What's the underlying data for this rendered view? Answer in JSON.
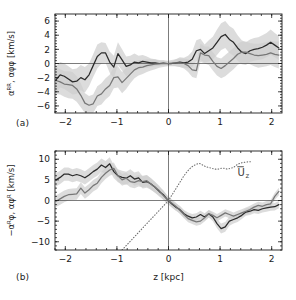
{
  "figure": {
    "background": "#ffffff",
    "width": 296,
    "height": 300
  },
  "panels": [
    {
      "tag": "(a)",
      "ylabel": "αᴿᴿ,  αφφ   [km/s]",
      "xlabel": "",
      "ytick_labels": [
        "6",
        "4",
        "2",
        "0",
        "−2",
        "−4",
        "−6"
      ],
      "xtick_labels": [
        "−2",
        "−1",
        "0",
        "1",
        "2"
      ]
    },
    {
      "tag": "(b)",
      "ylabel": "−αᴿφ,  αφᴿ   [km/s]",
      "xlabel": "z  [kpc]",
      "ytick_labels": [
        "10",
        "5",
        "0",
        "−5",
        "−10"
      ],
      "xtick_labels": [
        "−2",
        "−1",
        "0",
        "1",
        "2"
      ],
      "annotation": "U̅z"
    }
  ],
  "colors": {
    "dark_curve": "#2b2b2b",
    "gray_curve": "#777777",
    "band": "#cfcfcf",
    "axis": "#1a1a1a",
    "zero_line": "#444444",
    "dotted_curve": "#6e6e6e"
  },
  "chart_data": [
    {
      "type": "line",
      "title": "(a)",
      "xlabel": "z [kpc]",
      "ylabel": "alpha_RR, alpha_phiphi [km/s]",
      "xlim": [
        -2.2,
        2.2
      ],
      "ylim": [
        -7.0,
        7.0
      ],
      "xticks": [
        -2,
        -1,
        0,
        1,
        2
      ],
      "yticks": [
        -6,
        -4,
        -2,
        0,
        2,
        4,
        6
      ],
      "grid": false,
      "legend": "none",
      "zero_lines": {
        "horizontal": 0,
        "vertical": 0
      },
      "x": [
        -2.18,
        -2.1,
        -2.02,
        -1.94,
        -1.86,
        -1.78,
        -1.7,
        -1.62,
        -1.54,
        -1.46,
        -1.38,
        -1.3,
        -1.22,
        -1.14,
        -1.06,
        -0.98,
        -0.9,
        -0.82,
        -0.74,
        -0.66,
        -0.58,
        -0.5,
        -0.42,
        -0.34,
        -0.26,
        -0.18,
        -0.1,
        -0.02,
        0.06,
        0.14,
        0.22,
        0.3,
        0.38,
        0.46,
        0.54,
        0.62,
        0.7,
        0.78,
        0.86,
        0.94,
        1.02,
        1.1,
        1.18,
        1.26,
        1.34,
        1.42,
        1.5,
        1.58,
        1.66,
        1.74,
        1.82,
        1.9,
        1.98,
        2.06,
        2.14
      ],
      "series": [
        {
          "name": "alpha_RR",
          "color": "#2b2b2b",
          "values": [
            -2.3,
            -1.6,
            -1.8,
            -2.2,
            -2.6,
            -2.5,
            -2.0,
            -2.3,
            -1.6,
            -0.3,
            1.0,
            1.5,
            1.5,
            0.2,
            -0.5,
            1.4,
            0.5,
            -0.4,
            -0.2,
            0.2,
            0.1,
            0.3,
            0.2,
            0.1,
            0.1,
            0.0,
            0.05,
            0.0,
            0.0,
            0.1,
            0.2,
            0.1,
            0.2,
            0.6,
            1.8,
            2.0,
            1.4,
            1.8,
            2.2,
            3.0,
            3.8,
            4.1,
            3.4,
            3.0,
            2.2,
            1.6,
            1.4,
            1.8,
            2.0,
            2.1,
            2.3,
            2.6,
            3.0,
            2.6,
            2.2
          ],
          "band_lower": [
            -4.2,
            -3.4,
            -3.6,
            -4.0,
            -4.4,
            -4.3,
            -3.8,
            -4.1,
            -3.2,
            -1.9,
            -0.7,
            0.0,
            0.1,
            -1.3,
            -2.1,
            -0.2,
            -1.0,
            -1.8,
            -1.5,
            -1.0,
            -0.9,
            -0.6,
            -0.6,
            -0.5,
            -0.4,
            -0.4,
            -0.3,
            -0.3,
            -0.3,
            -0.4,
            -0.5,
            -0.6,
            -0.7,
            -0.5,
            0.3,
            0.5,
            0.1,
            0.3,
            0.6,
            1.2,
            1.9,
            2.2,
            1.5,
            1.1,
            0.4,
            -0.1,
            -0.2,
            0.2,
            0.4,
            0.5,
            0.6,
            0.9,
            1.2,
            0.9,
            0.5
          ],
          "band_upper": [
            -0.4,
            0.2,
            0.0,
            -0.4,
            -0.8,
            -0.7,
            -0.2,
            -0.5,
            0.0,
            1.3,
            2.7,
            3.0,
            2.9,
            1.7,
            1.1,
            3.0,
            2.0,
            1.0,
            1.1,
            1.4,
            1.1,
            1.2,
            1.0,
            0.7,
            0.6,
            0.4,
            0.4,
            0.3,
            0.3,
            0.6,
            0.9,
            0.8,
            1.1,
            1.7,
            3.3,
            3.5,
            2.7,
            3.3,
            3.8,
            4.8,
            5.7,
            6.0,
            5.3,
            4.9,
            4.0,
            3.3,
            3.0,
            3.4,
            3.6,
            3.7,
            4.0,
            4.3,
            4.8,
            4.3,
            3.9
          ]
        },
        {
          "name": "alpha_phiphi",
          "color": "#777777",
          "values": [
            -2.4,
            -2.6,
            -2.9,
            -3.0,
            -3.1,
            -3.6,
            -4.5,
            -5.6,
            -5.9,
            -5.7,
            -4.6,
            -4.3,
            -3.6,
            -3.1,
            -2.0,
            -1.9,
            -2.7,
            -2.1,
            -1.5,
            -0.9,
            -0.6,
            -0.5,
            -0.3,
            -0.2,
            -0.1,
            -0.05,
            0.0,
            0.0,
            0.05,
            0.1,
            0.1,
            0.0,
            -0.3,
            -0.9,
            -1.0,
            1.5,
            1.2,
            1.1,
            0.3,
            -0.4,
            -0.7,
            -0.3,
            0.2,
            0.7,
            1.3,
            1.6,
            1.6,
            1.4,
            1.2,
            1.1,
            1.2,
            1.3,
            1.5,
            1.3,
            1.2
          ],
          "band_lower": [
            -4.3,
            -4.4,
            -4.7,
            -4.9,
            -5.0,
            -5.4,
            -6.2,
            -7.0,
            -7.2,
            -7.0,
            -6.0,
            -5.8,
            -5.1,
            -4.6,
            -3.5,
            -3.4,
            -4.2,
            -3.6,
            -2.8,
            -2.1,
            -1.7,
            -1.5,
            -1.2,
            -1.0,
            -0.8,
            -0.6,
            -0.5,
            -0.4,
            -0.4,
            -0.4,
            -0.5,
            -0.7,
            -1.2,
            -1.9,
            -2.1,
            0.2,
            0.0,
            -0.2,
            -1.0,
            -1.7,
            -2.1,
            -1.8,
            -1.3,
            -0.8,
            -0.2,
            0.1,
            0.1,
            -0.1,
            -0.4,
            -0.6,
            -0.5,
            -0.4,
            -0.2,
            -0.5,
            -0.7
          ],
          "band_upper": [
            -0.5,
            -0.8,
            -1.1,
            -1.1,
            -1.2,
            -1.8,
            -2.8,
            -4.2,
            -4.6,
            -4.4,
            -3.2,
            -2.8,
            -2.1,
            -1.6,
            -0.5,
            -0.4,
            -1.2,
            -0.6,
            -0.2,
            0.3,
            0.5,
            0.5,
            0.6,
            0.6,
            0.6,
            0.5,
            0.5,
            0.4,
            0.5,
            0.6,
            0.7,
            0.7,
            0.6,
            0.1,
            0.1,
            2.8,
            2.4,
            2.4,
            1.6,
            0.9,
            0.7,
            1.2,
            1.7,
            2.2,
            2.8,
            3.1,
            3.1,
            2.9,
            2.8,
            2.8,
            2.9,
            3.0,
            3.2,
            3.1,
            3.1
          ]
        }
      ]
    },
    {
      "type": "line",
      "title": "(b)",
      "xlabel": "z [kpc]",
      "ylabel": "-alpha_Rphi, alpha_phiR [km/s]",
      "xlim": [
        -2.2,
        2.2
      ],
      "ylim": [
        -12.0,
        12.0
      ],
      "xticks": [
        -2,
        -1,
        0,
        1,
        2
      ],
      "yticks": [
        -10,
        -5,
        0,
        5,
        10
      ],
      "grid": false,
      "legend": "none",
      "zero_lines": {
        "horizontal": 0,
        "vertical": 0
      },
      "x": [
        -2.18,
        -2.1,
        -2.02,
        -1.94,
        -1.86,
        -1.78,
        -1.7,
        -1.62,
        -1.54,
        -1.46,
        -1.38,
        -1.3,
        -1.22,
        -1.14,
        -1.06,
        -0.98,
        -0.9,
        -0.82,
        -0.74,
        -0.66,
        -0.58,
        -0.5,
        -0.42,
        -0.34,
        -0.26,
        -0.18,
        -0.1,
        -0.02,
        0.06,
        0.14,
        0.22,
        0.3,
        0.38,
        0.46,
        0.54,
        0.62,
        0.7,
        0.78,
        0.86,
        0.94,
        1.02,
        1.1,
        1.18,
        1.26,
        1.34,
        1.42,
        1.5,
        1.58,
        1.66,
        1.74,
        1.82,
        1.9,
        1.98,
        2.06,
        2.14
      ],
      "series": [
        {
          "name": "-alpha_Rphi",
          "color": "#2b2b2b",
          "values": [
            5.0,
            5.6,
            6.4,
            6.4,
            6.0,
            6.3,
            6.0,
            5.5,
            6.2,
            7.0,
            7.6,
            8.6,
            8.0,
            8.9,
            7.0,
            6.0,
            5.6,
            5.4,
            6.0,
            5.2,
            5.5,
            4.4,
            4.6,
            4.0,
            3.2,
            2.2,
            1.4,
            0.2,
            -0.8,
            -1.6,
            -2.2,
            -3.2,
            -3.8,
            -4.2,
            -4.0,
            -3.4,
            -4.0,
            -3.2,
            -4.0,
            -5.6,
            -6.8,
            -6.4,
            -5.0,
            -4.6,
            -4.2,
            -3.6,
            -2.8,
            -2.6,
            -2.2,
            -2.4,
            -2.0,
            -1.8,
            -1.6,
            -1.5,
            -1.0
          ],
          "band_lower": [
            3.4,
            4.0,
            4.8,
            4.8,
            4.4,
            4.7,
            4.4,
            3.9,
            4.6,
            5.4,
            6.0,
            7.0,
            6.4,
            7.3,
            5.4,
            4.4,
            4.0,
            3.8,
            4.4,
            3.6,
            3.9,
            2.9,
            3.1,
            2.6,
            1.9,
            1.0,
            0.3,
            -0.7,
            -1.7,
            -2.5,
            -3.1,
            -4.1,
            -4.7,
            -5.1,
            -4.9,
            -4.3,
            -4.9,
            -4.1,
            -5.0,
            -6.7,
            -8.0,
            -7.6,
            -6.1,
            -5.6,
            -5.2,
            -4.5,
            -3.7,
            -3.5,
            -3.1,
            -3.3,
            -2.9,
            -2.7,
            -2.5,
            -2.4,
            -1.9
          ],
          "band_upper": [
            6.6,
            7.2,
            8.0,
            8.0,
            7.6,
            7.9,
            7.6,
            7.1,
            7.8,
            8.6,
            9.2,
            10.2,
            9.6,
            10.5,
            8.6,
            7.6,
            7.2,
            7.0,
            7.6,
            6.8,
            7.1,
            5.9,
            6.1,
            5.4,
            4.5,
            3.4,
            2.5,
            1.1,
            0.1,
            -0.7,
            -1.3,
            -2.3,
            -2.9,
            -3.3,
            -3.1,
            -2.5,
            -3.1,
            -2.3,
            -3.0,
            -4.5,
            -5.6,
            -5.2,
            -3.9,
            -3.6,
            -3.2,
            -2.7,
            -1.9,
            -1.7,
            -1.3,
            -1.5,
            -1.1,
            -0.9,
            -0.7,
            -0.6,
            -0.1
          ]
        },
        {
          "name": "alpha_phiR",
          "color": "#777777",
          "values": [
            -0.2,
            0.4,
            1.0,
            1.4,
            1.5,
            1.6,
            3.0,
            1.8,
            2.6,
            3.6,
            4.2,
            5.6,
            6.6,
            7.4,
            7.8,
            6.0,
            5.0,
            5.4,
            4.6,
            4.4,
            4.8,
            4.6,
            4.8,
            4.0,
            3.2,
            2.4,
            1.2,
            0.2,
            -0.6,
            -1.4,
            -2.4,
            -3.4,
            -4.4,
            -4.8,
            -5.2,
            -5.0,
            -4.2,
            -3.2,
            -3.6,
            -4.2,
            -3.6,
            -3.0,
            -3.4,
            -3.8,
            -3.4,
            -3.0,
            -2.6,
            -2.2,
            -1.6,
            -1.2,
            -1.4,
            -1.0,
            -0.8,
            1.0,
            2.2
          ],
          "band_lower": [
            -1.6,
            -1.0,
            -0.4,
            0.0,
            0.1,
            0.2,
            1.6,
            0.4,
            1.2,
            2.2,
            2.8,
            4.2,
            5.2,
            6.0,
            6.4,
            4.6,
            3.6,
            4.0,
            3.2,
            3.0,
            3.4,
            3.2,
            3.4,
            2.6,
            1.9,
            1.2,
            0.1,
            -0.8,
            -1.5,
            -2.3,
            -3.3,
            -4.3,
            -5.3,
            -5.7,
            -6.1,
            -5.9,
            -5.1,
            -4.1,
            -4.5,
            -5.1,
            -4.5,
            -3.9,
            -4.3,
            -4.7,
            -4.3,
            -3.9,
            -3.5,
            -3.1,
            -2.5,
            -2.1,
            -2.3,
            -1.9,
            -1.7,
            0.1,
            1.3
          ],
          "band_upper": [
            1.2,
            1.8,
            2.4,
            2.8,
            2.9,
            3.0,
            4.4,
            3.2,
            4.0,
            5.0,
            5.6,
            7.0,
            8.0,
            8.8,
            9.2,
            7.4,
            6.4,
            6.8,
            6.0,
            5.8,
            6.2,
            6.0,
            6.2,
            5.4,
            4.5,
            3.6,
            2.3,
            1.2,
            0.3,
            -0.5,
            -1.5,
            -2.5,
            -3.5,
            -3.9,
            -4.3,
            -4.1,
            -3.3,
            -2.3,
            -2.7,
            -3.3,
            -2.7,
            -2.1,
            -2.5,
            -2.9,
            -2.5,
            -2.1,
            -1.7,
            -1.3,
            -0.7,
            -0.3,
            -0.5,
            -0.1,
            0.1,
            1.9,
            3.1
          ]
        },
        {
          "name": "Uz_mean",
          "style": "dotted",
          "color": "#6e6e6e",
          "x": [
            -0.9,
            -0.84,
            -0.78,
            -0.72,
            -0.66,
            -0.6,
            -0.54,
            -0.48,
            -0.42,
            -0.36,
            -0.3,
            -0.24,
            -0.18,
            -0.12,
            -0.06,
            0.0,
            0.06,
            0.12,
            0.18,
            0.24,
            0.3,
            0.36,
            0.42,
            0.48,
            0.54,
            0.6,
            0.66,
            0.72,
            0.78,
            0.84,
            0.9,
            0.96,
            1.02,
            1.08,
            1.14,
            1.2,
            1.26,
            1.32,
            1.38,
            1.44,
            1.5,
            1.56,
            1.62
          ],
          "values": [
            -12.0,
            -11.2,
            -10.4,
            -9.6,
            -8.8,
            -8.0,
            -7.2,
            -6.4,
            -5.6,
            -4.8,
            -4.0,
            -3.2,
            -2.4,
            -1.6,
            -0.8,
            0.0,
            1.2,
            2.4,
            3.6,
            4.8,
            6.0,
            7.0,
            7.8,
            8.4,
            8.8,
            9.0,
            8.6,
            8.2,
            8.0,
            7.8,
            7.6,
            7.6,
            7.8,
            7.8,
            7.6,
            7.8,
            8.0,
            8.6,
            9.0,
            9.2,
            9.3,
            9.4,
            9.4
          ]
        }
      ],
      "annotations": [
        {
          "text": "U̅z",
          "x": 1.45,
          "y": 6.0
        }
      ]
    }
  ]
}
